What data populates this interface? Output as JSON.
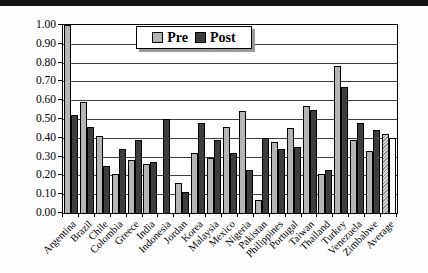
{
  "legend": {
    "items": [
      {
        "label": "Pre",
        "swatch": "light-gray"
      },
      {
        "label": "Post",
        "swatch": "dark-gray"
      }
    ]
  },
  "chart_data": {
    "type": "bar",
    "title": "",
    "xlabel": "",
    "ylabel": "",
    "categories": [
      "Argentina",
      "Brazil",
      "Chile",
      "Colombia",
      "Greece",
      "India",
      "Indonesia",
      "Jordan",
      "Korea",
      "Malaysia",
      "Mexico",
      "Nigeria",
      "Pakistan",
      "Philippines",
      "Portugal",
      "Taiwan",
      "Thailand",
      "Turkey",
      "Venezuela",
      "Zimbabwe",
      "Average"
    ],
    "series": [
      {
        "name": "Pre",
        "values": [
          1.0,
          0.59,
          0.41,
          0.21,
          0.28,
          0.26,
          null,
          0.16,
          0.32,
          0.29,
          0.46,
          0.54,
          0.07,
          0.38,
          0.45,
          0.57,
          0.21,
          0.78,
          0.39,
          0.33,
          0.42
        ]
      },
      {
        "name": "Post",
        "values": [
          0.52,
          0.46,
          0.25,
          0.34,
          0.39,
          0.27,
          0.5,
          0.11,
          0.48,
          0.39,
          0.32,
          0.23,
          0.4,
          0.34,
          0.35,
          0.55,
          0.23,
          0.67,
          0.48,
          0.44,
          0.4
        ]
      }
    ],
    "ylim": [
      0.0,
      1.0
    ],
    "ytick_labels": [
      "0.00",
      "0.10",
      "0.20",
      "0.30",
      "0.40",
      "0.50",
      "0.60",
      "0.70",
      "0.80",
      "0.90",
      "1.00"
    ],
    "grid": true,
    "legend_position": "top-center",
    "colors": {
      "pre": "#b5b5b5",
      "post": "#3d3d3d",
      "gridline": "#3c3c3c",
      "axis": "#000000",
      "background": "#ffffff"
    },
    "notes": {
      "indonesia_pre": "no bar shown",
      "average_pre_style": "hatched",
      "average_post_style": "hollow-white"
    }
  }
}
